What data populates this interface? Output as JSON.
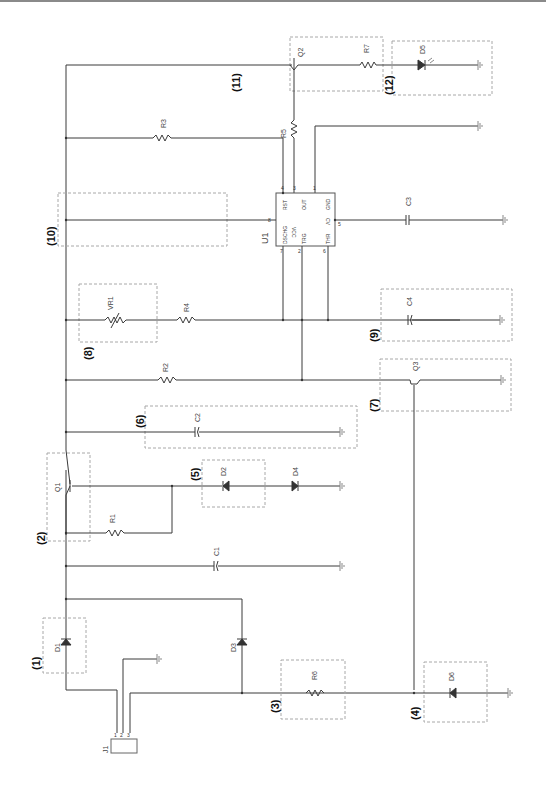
{
  "diagram": {
    "type": "circuit-schematic",
    "orientation": "rotated-90",
    "colors": {
      "wire": "#3a3a3a",
      "box": "#a8a8a8",
      "ground": "#888888",
      "text": "#444444"
    },
    "block_numbers": [
      "(1)",
      "(2)",
      "(3)",
      "(4)",
      "(5)",
      "(6)",
      "(7)",
      "(8)",
      "(9)",
      "(10)",
      "(11)",
      "(12)"
    ],
    "components": {
      "J1": "J1",
      "J1_pins": [
        "1",
        "2",
        "3"
      ],
      "D1": "D1",
      "D2": "D2",
      "D3": "D3",
      "D4": "D4",
      "D5": "D5",
      "D6": "D6",
      "Q1": "Q1",
      "Q2": "Q2",
      "Q3": "Q3",
      "R1": "R1",
      "R2": "R2",
      "R3": "R3",
      "R4": "R4",
      "R5": "R5",
      "R6": "R6",
      "R7": "R7",
      "C1": "C1",
      "C2": "C2",
      "C3": "C3",
      "C4": "C4",
      "VR1": "VR1",
      "U1": "U1"
    },
    "u1_pins": {
      "RST": "RST",
      "OUT": "OUT",
      "GND": "GND",
      "DSCHG": "DSCHG",
      "CV": "CV",
      "TRG": "TRG",
      "THR": "THR",
      "p4": "4",
      "p3": "3",
      "p1": "1",
      "p8": "8",
      "p5": "5",
      "p7": "7",
      "p2": "2",
      "p6": "6",
      "vcc": "VCC"
    }
  }
}
